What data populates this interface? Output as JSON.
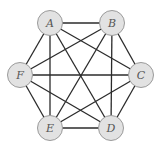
{
  "diagram": {
    "type": "complete-graph",
    "name": "K6",
    "colors": {
      "node_fill": "#e2e2e2",
      "node_stroke": "#9a9a9a",
      "edge": "#2b2b2b",
      "label": "#555555",
      "background": "#ffffff"
    },
    "node_radius": 12.5,
    "nodes": [
      {
        "id": "A",
        "label": "A",
        "x": 50,
        "y": 23
      },
      {
        "id": "B",
        "label": "B",
        "x": 112,
        "y": 23
      },
      {
        "id": "C",
        "label": "C",
        "x": 141,
        "y": 75
      },
      {
        "id": "D",
        "label": "D",
        "x": 111,
        "y": 128
      },
      {
        "id": "E",
        "label": "E",
        "x": 50,
        "y": 128
      },
      {
        "id": "F",
        "label": "F",
        "x": 20,
        "y": 75
      }
    ],
    "edges": [
      [
        "A",
        "B"
      ],
      [
        "A",
        "C"
      ],
      [
        "A",
        "D"
      ],
      [
        "A",
        "E"
      ],
      [
        "A",
        "F"
      ],
      [
        "B",
        "C"
      ],
      [
        "B",
        "D"
      ],
      [
        "B",
        "E"
      ],
      [
        "B",
        "F"
      ],
      [
        "C",
        "D"
      ],
      [
        "C",
        "E"
      ],
      [
        "C",
        "F"
      ],
      [
        "D",
        "E"
      ],
      [
        "D",
        "F"
      ],
      [
        "E",
        "F"
      ]
    ]
  }
}
